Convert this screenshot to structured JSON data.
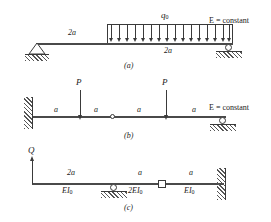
{
  "figure": {
    "kind": "structural-beam-diagrams",
    "panels": [
      "a",
      "b",
      "c"
    ]
  },
  "panel_a": {
    "caption": "(a)",
    "span_label_left": "2a",
    "span_label_loaded": "2a",
    "distributed_load_symbol": "q",
    "distributed_load_subscript": "0",
    "note": "E = constant",
    "supports": {
      "left": "pin-support",
      "right": "roller-support"
    },
    "arrow_count": 16
  },
  "panel_b": {
    "caption": "(b)",
    "segments": [
      "a",
      "a",
      "a",
      "a"
    ],
    "point_loads": [
      "P",
      "P"
    ],
    "note": "E = constant",
    "supports": {
      "left": "fixed-wall-support",
      "right": "roller-support",
      "middle": "internal-hinge"
    }
  },
  "panel_c": {
    "caption": "(c)",
    "applied_force": "Q",
    "segments": [
      {
        "length": "2a",
        "stiffness": "EI",
        "stiffness_sub": "0"
      },
      {
        "length": "a",
        "stiffness": "2EI",
        "stiffness_sub": "0"
      },
      {
        "length": "a",
        "stiffness": "EI",
        "stiffness_sub": "0"
      }
    ],
    "supports": {
      "left": "free-end-with-upward-force",
      "middle": "roller-support",
      "right": "fixed-wall-support",
      "connection": "internal-slider-connection"
    }
  },
  "colors": {
    "line": "#3a3a3a",
    "beam": "#4a4a4a",
    "hatch": "#555555",
    "background": "#ffffff"
  }
}
